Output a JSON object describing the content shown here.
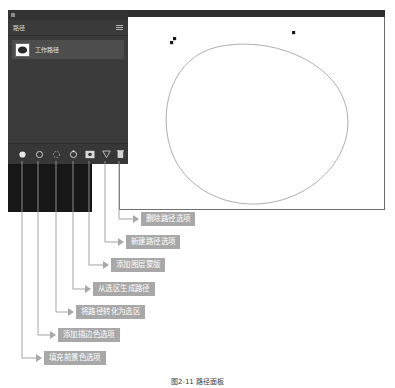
{
  "app": {
    "panel": {
      "tab_label": "路径",
      "menu_icon": "panel-menu-icon",
      "close_icon": "panel-close-icon",
      "path_item": {
        "name": "工作路径",
        "thumbnail_icon": "path-thumbnail-icon"
      },
      "footer_buttons": [
        {
          "icon": "fill-foreground-color-icon",
          "title": "填充前景色选项"
        },
        {
          "icon": "stroke-color-icon",
          "title": "添加描边色选项"
        },
        {
          "icon": "path-to-selection-icon",
          "title": "将路径转化为选区"
        },
        {
          "icon": "selection-to-path-icon",
          "title": "从选区生成路径"
        },
        {
          "icon": "add-layer-mask-icon",
          "title": "添加图层蒙版"
        },
        {
          "icon": "new-path-icon",
          "title": "新建路径选项"
        },
        {
          "icon": "delete-path-icon",
          "title": "删除路径选项"
        }
      ]
    },
    "document": {
      "canvas_path_icon": "ellipse-path",
      "anchor_points": 3
    },
    "callouts": [
      {
        "label": "删除路径选项"
      },
      {
        "label": "新建路径选项"
      },
      {
        "label": "添加图层蒙版"
      },
      {
        "label": "从选区生成路径"
      },
      {
        "label": "将路径转化为选区"
      },
      {
        "label": "添加描边色选项"
      },
      {
        "label": "填充前景色选项"
      }
    ],
    "caption": "图2-11  路径面板"
  },
  "colors": {
    "panel_bg": "#383838",
    "panel_row": "#4d4d4d",
    "callout_bg": "#a8a8a8",
    "dark_block": "#171717",
    "canvas_bg": "#ffffff",
    "leader": "#8f8f8f"
  }
}
